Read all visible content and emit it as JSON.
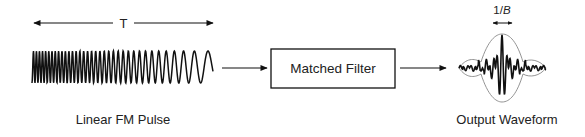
{
  "diagram": {
    "input": {
      "duration_label": "T",
      "caption": "Linear FM Pulse"
    },
    "block": {
      "label": "Matched Filter"
    },
    "output": {
      "width_label_prefix": "1/",
      "width_label_var": "B",
      "caption": "Output Waveform"
    }
  }
}
